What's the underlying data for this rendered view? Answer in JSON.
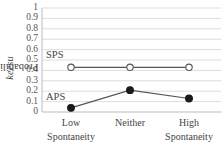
{
  "chart_data": {
    "type": "line",
    "title": "",
    "xlabel": "",
    "ylabel": "Probability of keesu",
    "ylabel_plain": "Probability of",
    "ylabel_italic": "keesu",
    "ylim": [
      0,
      1
    ],
    "yticks": [
      "0",
      "0.1",
      "0.2",
      "0.3",
      "0.4",
      "0.5",
      "0.6",
      "0.7",
      "0.8",
      "0.9",
      "1"
    ],
    "grid": true,
    "legend_position": "inline labels on left",
    "categories": [
      "Low Spontaneity",
      "Neither",
      "High Spontaneity"
    ],
    "category_lines": [
      [
        "Low",
        "Spontaneity"
      ],
      [
        "Neither",
        ""
      ],
      [
        "High",
        "Spontaneity"
      ]
    ],
    "series": [
      {
        "name": "SPS",
        "marker": "open-circle",
        "values": [
          0.43,
          0.43,
          0.43
        ]
      },
      {
        "name": "APS",
        "marker": "filled-circle",
        "values": [
          0.04,
          0.21,
          0.13
        ]
      }
    ]
  },
  "colors": {
    "line": "#555555",
    "grid": "#dddddd",
    "axis": "#bbbbbb",
    "marker_fill_filled": "#1a1a1a",
    "marker_fill_open": "#ffffff"
  }
}
